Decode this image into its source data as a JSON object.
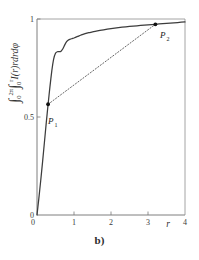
{
  "figure": {
    "caption": "b)",
    "ylabel_parts": {
      "int1": "∫",
      "int1_lower": "0",
      "int1_upper": "2π",
      "int2": "∫",
      "int2_lower": "0",
      "int2_upper": "r",
      "integrand": "I(r)rdrdφ"
    },
    "ylabel_plain": "∫0^2π ∫0^r I(r) r dr dφ"
  },
  "chart_data": {
    "type": "line",
    "title": "",
    "xlabel": "r",
    "ylabel": "∫0^2π ∫0^r I(r) r dr dφ",
    "xlim": [
      0,
      4
    ],
    "ylim": [
      0,
      1
    ],
    "grid": false,
    "legend_position": "none",
    "xticks": [
      0,
      1,
      2,
      3,
      4
    ],
    "xtick_labels": [
      "0",
      "1",
      "2",
      "3",
      "4"
    ],
    "yticks": [
      0,
      0.5,
      1
    ],
    "ytick_labels": [
      "0",
      "0.5",
      "1"
    ],
    "series": [
      {
        "name": "cumulative-encircled-energy",
        "style": "solid",
        "color": "#3c3c3c",
        "x": [
          0.0,
          0.05,
          0.1,
          0.15,
          0.2,
          0.25,
          0.3,
          0.35,
          0.4,
          0.45,
          0.5,
          0.55,
          0.6,
          0.65,
          0.7,
          0.75,
          0.8,
          0.85,
          0.9,
          0.95,
          1.0,
          1.1,
          1.2,
          1.3,
          1.4,
          1.5,
          1.6,
          1.8,
          2.0,
          2.2,
          2.4,
          2.6,
          2.8,
          3.0,
          3.2,
          3.4,
          3.6,
          3.8,
          4.0
        ],
        "y": [
          0.0,
          0.085,
          0.175,
          0.27,
          0.37,
          0.47,
          0.565,
          0.655,
          0.735,
          0.795,
          0.825,
          0.833,
          0.833,
          0.836,
          0.848,
          0.868,
          0.884,
          0.893,
          0.897,
          0.9,
          0.903,
          0.911,
          0.919,
          0.925,
          0.93,
          0.934,
          0.938,
          0.945,
          0.951,
          0.956,
          0.96,
          0.964,
          0.967,
          0.97,
          0.973,
          0.976,
          0.979,
          0.982,
          0.985
        ]
      },
      {
        "name": "chord-P1-P2",
        "style": "dotted",
        "color": "#555555",
        "x": [
          0.3,
          3.2
        ],
        "y": [
          0.565,
          0.973
        ]
      }
    ],
    "annotations": [
      {
        "name": "P1",
        "label": "P",
        "subscript": "1",
        "x": 0.3,
        "y": 0.565,
        "marker": "dot"
      },
      {
        "name": "P2",
        "label": "P",
        "subscript": "2",
        "x": 3.2,
        "y": 0.973,
        "marker": "dot"
      }
    ]
  }
}
